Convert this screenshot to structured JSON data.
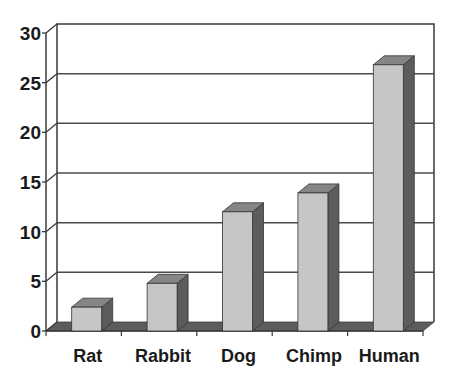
{
  "chart_data": {
    "type": "bar",
    "style": "3d-column",
    "title": "",
    "xlabel": "",
    "ylabel": "",
    "categories": [
      "Rat",
      "Rabbit",
      "Dog",
      "Chimp",
      "Human"
    ],
    "values": [
      2.4,
      4.8,
      12,
      13.9,
      26.8
    ],
    "ylim": [
      0,
      30
    ],
    "yticks": [
      0,
      5,
      10,
      15,
      20,
      25,
      30
    ],
    "grid": true,
    "legend": null
  },
  "colors": {
    "bar_front": "#c6c6c6",
    "bar_side": "#5c5c5c",
    "bar_top": "#858585",
    "floor": "#5c5c5c",
    "gridline": "#4a4a4a",
    "axis": "#3a3a3a",
    "background": "#ffffff"
  }
}
